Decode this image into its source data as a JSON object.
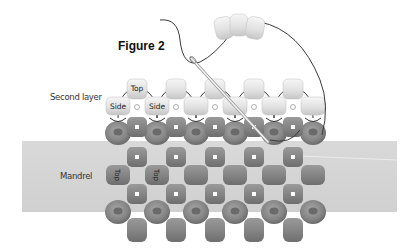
{
  "figure": {
    "title": "Figure 2",
    "labels": {
      "second_layer": "Second layer",
      "mandrel": "Mandrel"
    },
    "bead_labels": {
      "top": "Top",
      "side": "Side"
    },
    "colors": {
      "background": "#ffffff",
      "mandrel": "#d6d6d6",
      "base_bead": "#8a8a8a",
      "light_bead": "#e6e6e6",
      "thread": "#3a3a3a"
    },
    "structure": {
      "base_columns_round": 6,
      "base_columns_square": 5,
      "second_layer_top_beads": 5,
      "second_layer_side_beads": 6,
      "loose_beads_on_thread": 3
    }
  }
}
